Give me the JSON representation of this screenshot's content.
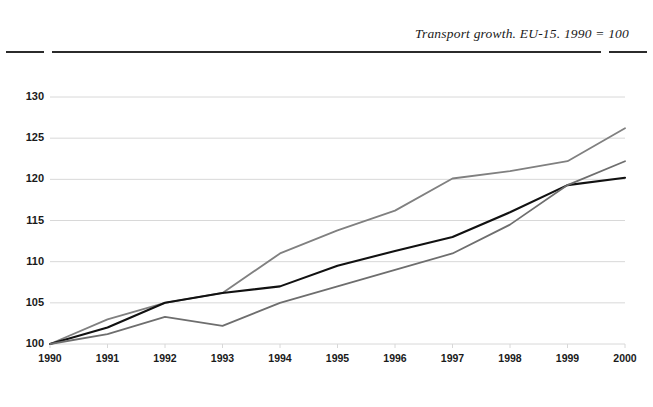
{
  "header": {
    "title": "Transport growth. EU-15. 1990 = 100"
  },
  "chart_data": {
    "type": "line",
    "title": "Transport growth. EU-15. 1990 = 100",
    "xlabel": "",
    "ylabel": "",
    "x": [
      1990,
      1991,
      1992,
      1993,
      1994,
      1995,
      1996,
      1997,
      1998,
      1999,
      2000
    ],
    "categories": [
      "1990",
      "1991",
      "1992",
      "1993",
      "1994",
      "1995",
      "1996",
      "1997",
      "1998",
      "1999",
      "2000"
    ],
    "xlim": [
      1990,
      2000
    ],
    "ylim": [
      100,
      130
    ],
    "yticks": [
      100,
      105,
      110,
      115,
      120,
      125,
      130
    ],
    "ytick_labels": [
      "100",
      "105",
      "110",
      "115",
      "120",
      "125",
      "130"
    ],
    "grid": "horizontal",
    "legend": "none",
    "series": [
      {
        "name": "series-upper",
        "color": "#808080",
        "width": 1.8,
        "values": [
          100,
          103,
          105,
          106.2,
          111,
          113.8,
          116.2,
          120.1,
          121,
          122.2,
          126.2
        ]
      },
      {
        "name": "series-middle",
        "color": "#111111",
        "width": 2.1,
        "values": [
          100,
          102,
          105,
          106.2,
          107,
          109.5,
          111.3,
          113,
          116,
          119.3,
          120.2
        ]
      },
      {
        "name": "series-lower",
        "color": "#6e6e6e",
        "width": 1.8,
        "values": [
          100,
          101.2,
          103.3,
          102.2,
          105,
          107,
          109,
          111,
          114.5,
          119.3,
          122.2
        ]
      }
    ]
  },
  "style": {
    "grid_color": "#d8d8d8",
    "rule_color": "#2b2b2b",
    "text_color": "#1a1a1a",
    "background": "#ffffff"
  }
}
